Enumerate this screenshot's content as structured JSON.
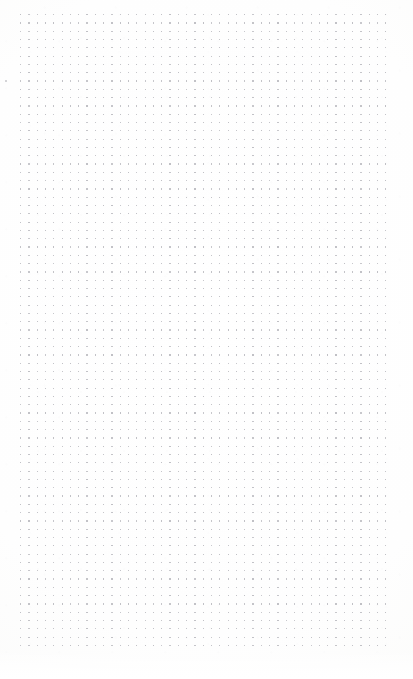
{
  "page": {
    "width": 413,
    "height": 679,
    "background_color": "#fdfdfd",
    "paper_tone": "#ffffff",
    "content_description": "Blank dot-grid (bullet journal) paper sheet with no writing, text, or interface elements"
  },
  "grid": {
    "type": "dot-lattice",
    "dot_color": "#9a9aa2",
    "dot_size_px": 1.3,
    "dot_opacity": 0.62,
    "spacing_x_px": 8.3,
    "spacing_y_px": 8.3,
    "first_dot_x_px": 20,
    "first_dot_y_px": 14,
    "last_dot_x_px": 393,
    "last_dot_y_px": 652,
    "columns": 46,
    "rows": 78,
    "margin_left_px": 20,
    "margin_right_px": 20,
    "margin_top_px": 14,
    "margin_bottom_px": 27
  },
  "marks": {
    "stray_speck_label": "faint speck in left margin",
    "stray_speck_x_px": 5,
    "stray_speck_y_px": 80
  },
  "annotations": {
    "text_content": "",
    "notes": "No legible text, icons, buttons, or controls are present anywhere in the image."
  }
}
